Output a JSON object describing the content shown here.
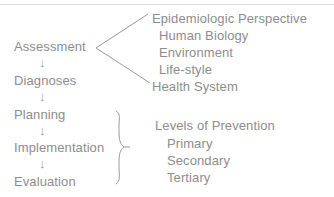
{
  "diagram": {
    "line_color": "#9a9a9a",
    "text_color": "#8d8d8d",
    "background": "#ffffff",
    "process_steps": [
      {
        "label": "Assessment"
      },
      {
        "label": "Diagnoses"
      },
      {
        "label": "Planning"
      },
      {
        "label": "Implementation"
      },
      {
        "label": "Evaluation"
      }
    ],
    "arrow_glyph": "↓",
    "determinants": {
      "items": [
        {
          "label": "Epidemiologic Perspective",
          "indent": false
        },
        {
          "label": "Human Biology",
          "indent": true
        },
        {
          "label": "Environment",
          "indent": true
        },
        {
          "label": "Life-style",
          "indent": true
        },
        {
          "label": "Health System",
          "indent": false
        }
      ]
    },
    "prevention": {
      "heading": "Levels of Prevention",
      "items": [
        {
          "label": "Primary"
        },
        {
          "label": "Secondary"
        },
        {
          "label": "Tertiary"
        }
      ]
    }
  }
}
